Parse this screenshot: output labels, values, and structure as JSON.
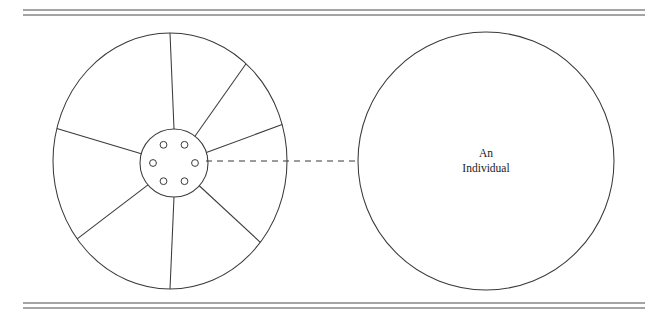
{
  "figure": {
    "rules": {
      "top": {
        "y1": 10,
        "y2": 15,
        "x_start": 23,
        "x_end": 645
      },
      "bottom": {
        "y1": 303,
        "y2": 308,
        "x_start": 23,
        "x_end": 645
      }
    },
    "wheel": {
      "name": "spoked-wheel",
      "cx": 170,
      "cy": 161,
      "rx": 117,
      "ry": 128,
      "hub": {
        "cx": 174,
        "cy": 163,
        "rx": 34,
        "ry": 34
      },
      "spoke_angles_deg": [
        -90,
        -52,
        -18,
        42,
        90,
        140,
        196
      ],
      "bolt_count": 6,
      "bolt_radius": 3.4,
      "bolt_ring_radius": 21,
      "bolt_angles_deg": [
        -120,
        -60,
        0,
        60,
        120,
        180
      ]
    },
    "connector": {
      "name": "dashed-connector",
      "x1": 206,
      "x2": 358,
      "y": 161
    },
    "individual": {
      "name": "individual-circle",
      "cx": 486,
      "cy": 161,
      "rx": 128,
      "ry": 129,
      "label_line1": "An",
      "label_line2": "Individual",
      "label_x": 486,
      "label_y1": 157,
      "label_y2": 172
    },
    "colors": {
      "stroke": "#3a3a3a",
      "rule": "#4a4a4a",
      "text": "#1a1a1a",
      "background": "#ffffff"
    }
  }
}
